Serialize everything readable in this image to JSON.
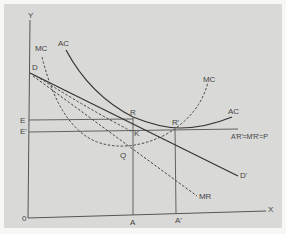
{
  "diagram": {
    "type": "economics-cost-revenue",
    "axes": {
      "y_label": "Y",
      "x_label": "X",
      "origin_label": "0"
    },
    "y_points": {
      "e": "E",
      "e_prime": "E'",
      "d": "D"
    },
    "x_points": {
      "a": "A",
      "a_prime": "A'"
    },
    "points": {
      "r": "R",
      "r_prime": "R'",
      "k": "K",
      "q": "Q"
    },
    "curves": {
      "mc_left": "MC",
      "ac_left": "AC",
      "mc_right": "MC",
      "ac_right": "AC",
      "demand_end": "D'",
      "mr": "MR",
      "price_line": "A'R'=M'R'=P"
    },
    "colors": {
      "background": "#d9d9d7",
      "line": "#333333",
      "label": "#444444"
    }
  }
}
